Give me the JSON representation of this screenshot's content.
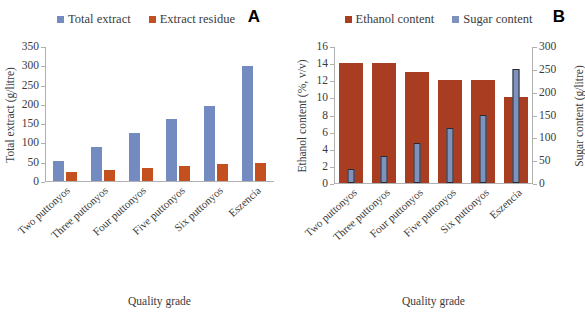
{
  "chart_data": [
    {
      "type": "bar",
      "panel": "A",
      "title": "",
      "xlabel": "Quality grade",
      "ylabel": "Total extract (g/litre)",
      "ylim": [
        0,
        350
      ],
      "yticks": [
        0,
        50,
        100,
        150,
        200,
        250,
        300,
        350
      ],
      "grid": false,
      "legend_position": "top",
      "categories": [
        "Two puttonyos",
        "Three puttonyos",
        "Four puttonyos",
        "Five puttonyos",
        "Six puttonyos",
        "Eszencia"
      ],
      "series": [
        {
          "name": "Total extract",
          "color": "#738bc0",
          "values": [
            53,
            89,
            124,
            160,
            194,
            299
          ]
        },
        {
          "name": "Extract residue",
          "color": "#c4501f",
          "values": [
            24,
            29,
            33,
            38,
            43,
            48
          ]
        }
      ]
    },
    {
      "type": "bar",
      "panel": "B",
      "title": "",
      "xlabel": "Quality grade",
      "ylabel": "Ethanol content (%, v/v)",
      "ylabel_secondary": "Sugar content (g/litre)",
      "ylim": [
        0,
        16
      ],
      "yticks": [
        0,
        2,
        4,
        6,
        8,
        10,
        12,
        14,
        16
      ],
      "ylim_secondary": [
        0,
        300
      ],
      "yticks_secondary": [
        0,
        50,
        100,
        150,
        200,
        250,
        300
      ],
      "grid": false,
      "legend_position": "top",
      "categories": [
        "Two puttonyos",
        "Three puttonyos",
        "Four puttonyos",
        "Five puttonyos",
        "Six puttonyos",
        "Eszencia"
      ],
      "series": [
        {
          "name": "Ethanol content",
          "color": "#a93d22",
          "axis": "left",
          "values": [
            14,
            14,
            13,
            12,
            12,
            10
          ]
        },
        {
          "name": "Sugar content",
          "color": "#7e92be",
          "axis": "right",
          "values": [
            30,
            60,
            88,
            120,
            150,
            250
          ]
        }
      ]
    }
  ],
  "panel_a": {
    "letter": "A",
    "legend": [
      {
        "label": "Total extract",
        "color": "#738bc0"
      },
      {
        "label": "Extract residue",
        "color": "#c4501f"
      }
    ],
    "y_axis": {
      "title": "Total extract (g/litre)",
      "ticks": [
        "350",
        "300",
        "250",
        "200",
        "150",
        "100",
        "50",
        "0"
      ]
    },
    "x_axis": {
      "title": "Quality grade",
      "categories": [
        "Two puttonyos",
        "Three puttonyos",
        "Four puttonyos",
        "Five puttonyos",
        "Six puttonyos",
        "Eszencia"
      ]
    }
  },
  "panel_b": {
    "letter": "B",
    "legend": [
      {
        "label": "Ethanol content",
        "color": "#a93d22"
      },
      {
        "label": "Sugar content",
        "color": "#7e92be"
      }
    ],
    "y_axis_left": {
      "title": "Ethanol content (%, v/v)",
      "ticks": [
        "16",
        "14",
        "12",
        "10",
        "8",
        "6",
        "4",
        "2",
        "0"
      ]
    },
    "y_axis_right": {
      "title": "Sugar content (g/litre)",
      "ticks": [
        "300",
        "250",
        "200",
        "150",
        "100",
        "50",
        "0"
      ]
    },
    "x_axis": {
      "title": "Quality grade",
      "categories": [
        "Two puttonyos",
        "Three puttonyos",
        "Four puttonyos",
        "Five puttonyos",
        "Six puttonyos",
        "Eszencia"
      ]
    }
  }
}
